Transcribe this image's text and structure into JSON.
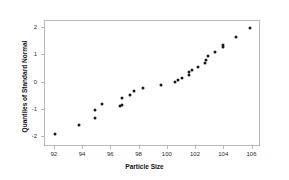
{
  "chart_data": {
    "type": "scatter",
    "title": "",
    "xlabel": "Particle Size",
    "ylabel": "Quantiles of Standard Normal",
    "xlim": [
      91.3,
      106.6
    ],
    "ylim": [
      -2.35,
      2.25
    ],
    "xticks": [
      92,
      94,
      96,
      98,
      100,
      102,
      104,
      106
    ],
    "yticks": [
      2,
      1,
      0,
      -1,
      -2
    ],
    "xtick_labels": [
      "92",
      "94",
      "96",
      "98",
      "100",
      "102",
      "104",
      "106"
    ],
    "ytick_labels": [
      "2",
      "1",
      "0",
      "-1",
      "-2"
    ],
    "grid": false,
    "legend": false,
    "marker_color": "#1a1a1a",
    "axis_color": "#b9b9b9",
    "points": [
      {
        "x": 92.1,
        "y": -1.91
      },
      {
        "x": 93.8,
        "y": -1.58
      },
      {
        "x": 94.9,
        "y": -1.05
      },
      {
        "x": 94.9,
        "y": -1.32
      },
      {
        "x": 95.4,
        "y": -0.8
      },
      {
        "x": 96.7,
        "y": -0.9
      },
      {
        "x": 96.8,
        "y": -0.85
      },
      {
        "x": 96.8,
        "y": -0.58
      },
      {
        "x": 97.4,
        "y": -0.49
      },
      {
        "x": 97.7,
        "y": -0.34
      },
      {
        "x": 98.3,
        "y": -0.24
      },
      {
        "x": 99.6,
        "y": -0.13
      },
      {
        "x": 100.6,
        "y": -0.02
      },
      {
        "x": 100.8,
        "y": 0.07
      },
      {
        "x": 101.1,
        "y": 0.12
      },
      {
        "x": 101.6,
        "y": 0.26
      },
      {
        "x": 101.6,
        "y": 0.34
      },
      {
        "x": 101.8,
        "y": 0.42
      },
      {
        "x": 102.2,
        "y": 0.53
      },
      {
        "x": 102.7,
        "y": 0.67
      },
      {
        "x": 102.8,
        "y": 0.8
      },
      {
        "x": 102.9,
        "y": 0.93
      },
      {
        "x": 103.4,
        "y": 1.07
      },
      {
        "x": 104.0,
        "y": 1.27
      },
      {
        "x": 104.0,
        "y": 1.33
      },
      {
        "x": 104.9,
        "y": 1.63
      },
      {
        "x": 105.9,
        "y": 1.97
      }
    ]
  }
}
